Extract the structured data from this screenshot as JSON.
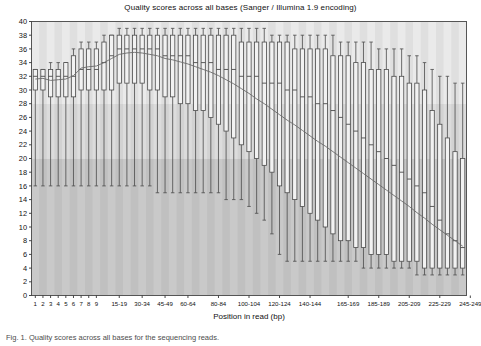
{
  "chart": {
    "title": "Quality scores across all bases (Sanger / Illumina 1.9 encoding)",
    "caption": "Fig. 1. Quality scores across all bases for the sequencing reads.",
    "xlabel": "Position in read (bp)",
    "ylabel": ""
  },
  "chart_data": {
    "type": "boxplot",
    "title": "Quality scores across all bases (Sanger / Illumina 1.9 encoding)",
    "xlabel": "Position in read (bp)",
    "ylabel": "",
    "ylim": [
      0,
      40
    ],
    "ytick_step": 2,
    "yticks": [
      0,
      2,
      4,
      6,
      8,
      10,
      12,
      14,
      16,
      18,
      20,
      22,
      24,
      26,
      28,
      30,
      32,
      34,
      36,
      38,
      40
    ],
    "grid": false,
    "legend": "none",
    "xtick_labels": [
      "1",
      "2",
      "3",
      "4",
      "5",
      "6",
      "7",
      "8",
      "9",
      "15-19",
      "30-34",
      "45-49",
      "60-64",
      "80-84",
      "100-104",
      "120-124",
      "140-144",
      "165-169",
      "185-189",
      "205-209",
      "225-229",
      "245-249"
    ],
    "xtick_positions": [
      0,
      1,
      2,
      3,
      4,
      5,
      6,
      7,
      8,
      11,
      14,
      17,
      20,
      24,
      28,
      32,
      36,
      41,
      45,
      49,
      53,
      57
    ],
    "quality_bands": [
      {
        "name": "good",
        "from": 28,
        "to": 40,
        "color": "#eaeaea"
      },
      {
        "name": "reasonable",
        "from": 20,
        "to": 28,
        "color": "#dcdcdc"
      },
      {
        "name": "poor",
        "from": 0,
        "to": 20,
        "color": "#c9c9c9"
      }
    ],
    "box_color": "#f2f2f2",
    "line_color": "#4a4a4a",
    "mean_line_color": "#6b6b6b",
    "categories": [
      "1",
      "2",
      "3",
      "4",
      "5",
      "6",
      "7",
      "8",
      "9",
      "10-14",
      "15-19",
      "20-24",
      "25-29",
      "30-34",
      "35-39",
      "40-44",
      "45-49",
      "50-54",
      "55-59",
      "60-64",
      "65-69",
      "70-74",
      "75-79",
      "80-84",
      "85-89",
      "90-94",
      "95-99",
      "100-104",
      "105-109",
      "110-114",
      "115-119",
      "120-124",
      "125-129",
      "130-134",
      "135-139",
      "140-144",
      "145-149",
      "150-154",
      "155-159",
      "160-164",
      "165-169",
      "170-174",
      "175-179",
      "180-184",
      "185-189",
      "190-194",
      "195-199",
      "200-204",
      "205-209",
      "210-214",
      "215-219",
      "220-224",
      "225-229",
      "230-234",
      "235-239",
      "240-244",
      "245-249"
    ],
    "boxes": [
      {
        "x": "1",
        "lower_whisker": 16,
        "q1": 30,
        "median": 32,
        "q3": 33,
        "upper_whisker": 33,
        "mean": 31.6
      },
      {
        "x": "2",
        "lower_whisker": 16,
        "q1": 30,
        "median": 32,
        "q3": 33,
        "upper_whisker": 33,
        "mean": 31.7
      },
      {
        "x": "3",
        "lower_whisker": 16,
        "q1": 29,
        "median": 32,
        "q3": 33,
        "upper_whisker": 34,
        "mean": 31.4
      },
      {
        "x": "4",
        "lower_whisker": 16,
        "q1": 29,
        "median": 32,
        "q3": 33,
        "upper_whisker": 34,
        "mean": 31.5
      },
      {
        "x": "5",
        "lower_whisker": 16,
        "q1": 29,
        "median": 32,
        "q3": 34,
        "upper_whisker": 34,
        "mean": 31.6
      },
      {
        "x": "6",
        "lower_whisker": 16,
        "q1": 29,
        "median": 32,
        "q3": 35,
        "upper_whisker": 36,
        "mean": 32.1
      },
      {
        "x": "7",
        "lower_whisker": 16,
        "q1": 30,
        "median": 33,
        "q3": 36,
        "upper_whisker": 37,
        "mean": 33.2
      },
      {
        "x": "8",
        "lower_whisker": 16,
        "q1": 30,
        "median": 33,
        "q3": 36,
        "upper_whisker": 37,
        "mean": 33.4
      },
      {
        "x": "9",
        "lower_whisker": 16,
        "q1": 30,
        "median": 33,
        "q3": 36,
        "upper_whisker": 37,
        "mean": 33.5
      },
      {
        "x": "10-14",
        "lower_whisker": 16,
        "q1": 30,
        "median": 34,
        "q3": 37,
        "upper_whisker": 38,
        "mean": 34.0
      },
      {
        "x": "15-19",
        "lower_whisker": 16,
        "q1": 30,
        "median": 35,
        "q3": 38,
        "upper_whisker": 38,
        "mean": 34.6
      },
      {
        "x": "20-24",
        "lower_whisker": 16,
        "q1": 31,
        "median": 36,
        "q3": 38,
        "upper_whisker": 39,
        "mean": 35.2
      },
      {
        "x": "25-29",
        "lower_whisker": 16,
        "q1": 31,
        "median": 36,
        "q3": 38,
        "upper_whisker": 39,
        "mean": 35.4
      },
      {
        "x": "30-34",
        "lower_whisker": 16,
        "q1": 31,
        "median": 36,
        "q3": 38,
        "upper_whisker": 39,
        "mean": 35.5
      },
      {
        "x": "35-39",
        "lower_whisker": 16,
        "q1": 31,
        "median": 36,
        "q3": 38,
        "upper_whisker": 39,
        "mean": 35.4
      },
      {
        "x": "40-44",
        "lower_whisker": 16,
        "q1": 30,
        "median": 36,
        "q3": 38,
        "upper_whisker": 39,
        "mean": 35.2
      },
      {
        "x": "45-49",
        "lower_whisker": 15,
        "q1": 30,
        "median": 36,
        "q3": 38,
        "upper_whisker": 39,
        "mean": 35.0
      },
      {
        "x": "50-54",
        "lower_whisker": 15,
        "q1": 29,
        "median": 35,
        "q3": 38,
        "upper_whisker": 39,
        "mean": 34.6
      },
      {
        "x": "55-59",
        "lower_whisker": 15,
        "q1": 29,
        "median": 35,
        "q3": 38,
        "upper_whisker": 39,
        "mean": 34.4
      },
      {
        "x": "60-64",
        "lower_whisker": 15,
        "q1": 28,
        "median": 35,
        "q3": 38,
        "upper_whisker": 39,
        "mean": 34.1
      },
      {
        "x": "65-69",
        "lower_whisker": 15,
        "q1": 28,
        "median": 35,
        "q3": 38,
        "upper_whisker": 39,
        "mean": 33.8
      },
      {
        "x": "70-74",
        "lower_whisker": 15,
        "q1": 27,
        "median": 34,
        "q3": 38,
        "upper_whisker": 39,
        "mean": 33.4
      },
      {
        "x": "75-79",
        "lower_whisker": 15,
        "q1": 27,
        "median": 34,
        "q3": 38,
        "upper_whisker": 39,
        "mean": 33.0
      },
      {
        "x": "80-84",
        "lower_whisker": 15,
        "q1": 26,
        "median": 34,
        "q3": 38,
        "upper_whisker": 39,
        "mean": 32.6
      },
      {
        "x": "85-89",
        "lower_whisker": 15,
        "q1": 25,
        "median": 33,
        "q3": 38,
        "upper_whisker": 39,
        "mean": 32.1
      },
      {
        "x": "90-94",
        "lower_whisker": 14,
        "q1": 24,
        "median": 33,
        "q3": 38,
        "upper_whisker": 39,
        "mean": 31.5
      },
      {
        "x": "95-99",
        "lower_whisker": 14,
        "q1": 23,
        "median": 33,
        "q3": 38,
        "upper_whisker": 39,
        "mean": 30.9
      },
      {
        "x": "100-104",
        "lower_whisker": 14,
        "q1": 22,
        "median": 32,
        "q3": 37,
        "upper_whisker": 39,
        "mean": 30.2
      },
      {
        "x": "105-109",
        "lower_whisker": 13,
        "q1": 21,
        "median": 32,
        "q3": 37,
        "upper_whisker": 39,
        "mean": 29.5
      },
      {
        "x": "110-114",
        "lower_whisker": 12,
        "q1": 20,
        "median": 32,
        "q3": 37,
        "upper_whisker": 39,
        "mean": 28.7
      },
      {
        "x": "115-119",
        "lower_whisker": 11,
        "q1": 19,
        "median": 31,
        "q3": 37,
        "upper_whisker": 39,
        "mean": 28.0
      },
      {
        "x": "120-124",
        "lower_whisker": 9,
        "q1": 18,
        "median": 31,
        "q3": 37,
        "upper_whisker": 38,
        "mean": 27.2
      },
      {
        "x": "125-129",
        "lower_whisker": 6,
        "q1": 16,
        "median": 31,
        "q3": 37,
        "upper_whisker": 38,
        "mean": 26.4
      },
      {
        "x": "130-134",
        "lower_whisker": 5,
        "q1": 15,
        "median": 30,
        "q3": 37,
        "upper_whisker": 38,
        "mean": 25.6
      },
      {
        "x": "135-139",
        "lower_whisker": 5,
        "q1": 14,
        "median": 30,
        "q3": 36,
        "upper_whisker": 38,
        "mean": 24.9
      },
      {
        "x": "140-144",
        "lower_whisker": 5,
        "q1": 13,
        "median": 29,
        "q3": 36,
        "upper_whisker": 38,
        "mean": 24.1
      },
      {
        "x": "145-149",
        "lower_whisker": 5,
        "q1": 12,
        "median": 29,
        "q3": 36,
        "upper_whisker": 38,
        "mean": 23.3
      },
      {
        "x": "150-154",
        "lower_whisker": 5,
        "q1": 11,
        "median": 28,
        "q3": 36,
        "upper_whisker": 38,
        "mean": 22.5
      },
      {
        "x": "155-159",
        "lower_whisker": 5,
        "q1": 10,
        "median": 28,
        "q3": 36,
        "upper_whisker": 38,
        "mean": 21.8
      },
      {
        "x": "160-164",
        "lower_whisker": 5,
        "q1": 9,
        "median": 27,
        "q3": 35,
        "upper_whisker": 38,
        "mean": 21.0
      },
      {
        "x": "165-169",
        "lower_whisker": 5,
        "q1": 8,
        "median": 26,
        "q3": 35,
        "upper_whisker": 37,
        "mean": 20.2
      },
      {
        "x": "170-174",
        "lower_whisker": 5,
        "q1": 8,
        "median": 25,
        "q3": 35,
        "upper_whisker": 37,
        "mean": 19.4
      },
      {
        "x": "175-179",
        "lower_whisker": 5,
        "q1": 7,
        "median": 24,
        "q3": 34,
        "upper_whisker": 37,
        "mean": 18.6
      },
      {
        "x": "180-184",
        "lower_whisker": 4,
        "q1": 7,
        "median": 23,
        "q3": 34,
        "upper_whisker": 37,
        "mean": 17.8
      },
      {
        "x": "185-189",
        "lower_whisker": 4,
        "q1": 6,
        "median": 22,
        "q3": 33,
        "upper_whisker": 37,
        "mean": 17.0
      },
      {
        "x": "190-194",
        "lower_whisker": 4,
        "q1": 6,
        "median": 21,
        "q3": 33,
        "upper_whisker": 36,
        "mean": 16.2
      },
      {
        "x": "195-199",
        "lower_whisker": 4,
        "q1": 6,
        "median": 20,
        "q3": 33,
        "upper_whisker": 36,
        "mean": 15.4
      },
      {
        "x": "200-204",
        "lower_whisker": 4,
        "q1": 5,
        "median": 19,
        "q3": 32,
        "upper_whisker": 36,
        "mean": 14.6
      },
      {
        "x": "205-209",
        "lower_whisker": 4,
        "q1": 5,
        "median": 18,
        "q3": 32,
        "upper_whisker": 36,
        "mean": 13.8
      },
      {
        "x": "210-214",
        "lower_whisker": 4,
        "q1": 5,
        "median": 17,
        "q3": 31,
        "upper_whisker": 35,
        "mean": 13.0
      },
      {
        "x": "215-219",
        "lower_whisker": 3,
        "q1": 5,
        "median": 16,
        "q3": 31,
        "upper_whisker": 35,
        "mean": 12.1
      },
      {
        "x": "220-224",
        "lower_whisker": 3,
        "q1": 4,
        "median": 15,
        "q3": 30,
        "upper_whisker": 34,
        "mean": 11.3
      },
      {
        "x": "225-229",
        "lower_whisker": 3,
        "q1": 4,
        "median": 13,
        "q3": 27,
        "upper_whisker": 33,
        "mean": 10.4
      },
      {
        "x": "230-234",
        "lower_whisker": 3,
        "q1": 4,
        "median": 11,
        "q3": 25,
        "upper_whisker": 32,
        "mean": 9.6
      },
      {
        "x": "235-239",
        "lower_whisker": 3,
        "q1": 4,
        "median": 9,
        "q3": 23,
        "upper_whisker": 32,
        "mean": 8.8
      },
      {
        "x": "240-244",
        "lower_whisker": 3,
        "q1": 4,
        "median": 8,
        "q3": 21,
        "upper_whisker": 31,
        "mean": 8.0
      },
      {
        "x": "245-249",
        "lower_whisker": 3,
        "q1": 4,
        "median": 7,
        "q3": 20,
        "upper_whisker": 31,
        "mean": 7.2
      }
    ]
  }
}
